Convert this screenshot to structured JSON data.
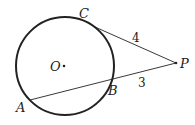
{
  "figure": {
    "points": {
      "O": {
        "label": "O"
      },
      "C": {
        "label": "C"
      },
      "P": {
        "label": "P"
      },
      "B": {
        "label": "B"
      },
      "A": {
        "label": "A"
      }
    },
    "segments": {
      "PC": {
        "length_label": "4"
      },
      "PB": {
        "length_label": "3"
      }
    },
    "colors": {
      "stroke": "#222222",
      "background": "#ffffff"
    }
  }
}
